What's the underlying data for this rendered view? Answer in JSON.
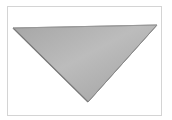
{
  "image": {
    "subject": "gray triangular bandana",
    "icon": "triangle-shape",
    "colors": {
      "fill_light": "#bdbdbd",
      "fill_mid": "#ababab",
      "fill_dark": "#9a9a9a",
      "edge": "#7e7e7e",
      "frame_border": "#d4d4d4",
      "background": "#ffffff"
    }
  }
}
